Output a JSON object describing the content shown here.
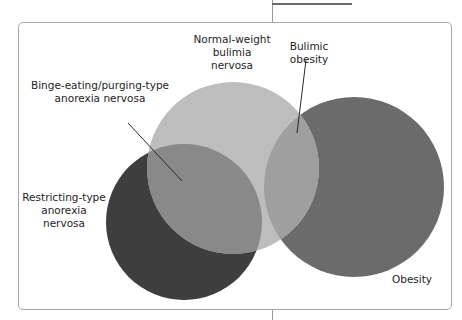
{
  "diagram": {
    "type": "venn",
    "sets": [
      {
        "id": "restricting",
        "label_lines": [
          "Restricting-type",
          "anorexia",
          "nervosa"
        ],
        "color": "#3e3e3e"
      },
      {
        "id": "normal_weight_bulimia",
        "label_lines": [
          "Normal-weight",
          "bulimia",
          "nervosa"
        ],
        "color": "#bdbdbd"
      },
      {
        "id": "obesity",
        "label_lines": [
          "Obesity"
        ],
        "color": "#6b6b6b"
      }
    ],
    "overlaps": [
      {
        "sets": [
          "restricting",
          "normal_weight_bulimia"
        ],
        "label_lines": [
          "Binge-eating/purging-type",
          "anorexia nervosa"
        ],
        "color": "#898989"
      },
      {
        "sets": [
          "normal_weight_bulimia",
          "obesity"
        ],
        "label_lines": [
          "Bulimic",
          "obesity"
        ],
        "color": "#9f9f9f"
      }
    ]
  },
  "labels": {
    "normal_weight": {
      "line1": "Normal-weight",
      "line2": "bulimia",
      "line3": "nervosa"
    },
    "bulimic_obesity": {
      "line1": "Bulimic",
      "line2": "obesity"
    },
    "binge_eating": {
      "line1": "Binge-eating/purging-type",
      "line2": "anorexia nervosa"
    },
    "restricting": {
      "line1": "Restricting-type",
      "line2": "anorexia",
      "line3": "nervosa"
    },
    "obesity": {
      "line1": "Obesity"
    }
  }
}
